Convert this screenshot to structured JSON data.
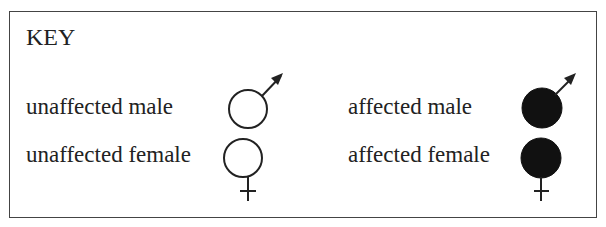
{
  "key": {
    "title": "KEY",
    "entries": [
      {
        "label": "unaffected male",
        "symbol": "male-symbol",
        "filled": false
      },
      {
        "label": "unaffected female",
        "symbol": "female-symbol",
        "filled": false
      },
      {
        "label": "affected male",
        "symbol": "male-symbol",
        "filled": true
      },
      {
        "label": "affected female",
        "symbol": "female-symbol",
        "filled": true
      }
    ],
    "colors": {
      "stroke": "#222222",
      "affected_fill": "#111111",
      "unaffected_fill": "#ffffff"
    }
  }
}
